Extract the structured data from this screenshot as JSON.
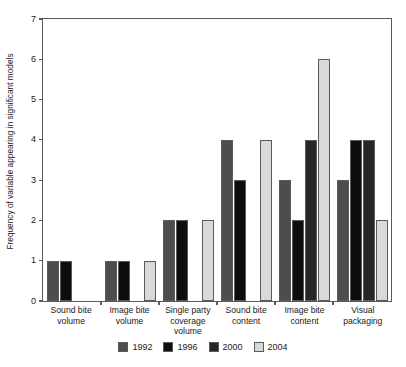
{
  "chart_data": {
    "type": "bar",
    "title": "",
    "subtitle": "",
    "xlabel": "",
    "ylabel": "Frequency of variable appearing in significant models",
    "ylim": [
      0,
      7
    ],
    "yticks": [
      0,
      1,
      2,
      3,
      4,
      5,
      6,
      7
    ],
    "grid": false,
    "legend_position": "bottom-center",
    "categories": [
      "Sound bite volume",
      "Image bite volume",
      "Single party coverage volume",
      "Sound bite content",
      "Image bite content",
      "Visual packaging"
    ],
    "series": [
      {
        "name": "1992",
        "color": "#4d4d4d",
        "values": [
          1,
          1,
          2,
          4,
          3,
          3
        ]
      },
      {
        "name": "1996",
        "color": "#0d0d0d",
        "values": [
          1,
          1,
          2,
          3,
          2,
          4
        ]
      },
      {
        "name": "2000",
        "color": "#262626",
        "values": [
          0,
          0,
          0,
          0,
          4,
          4
        ]
      },
      {
        "name": "2004",
        "color": "#d9d9d9",
        "values": [
          0,
          1,
          2,
          4,
          6,
          2
        ]
      }
    ]
  },
  "axis": {
    "y_tick_labels": [
      "7",
      "6",
      "5",
      "4",
      "3",
      "2",
      "1",
      "0"
    ],
    "y_title": "Frequency of variable appearing in significant models"
  },
  "category_lines": [
    [
      "Sound bite",
      "volume"
    ],
    [
      "Image bite",
      "volume"
    ],
    [
      "Single party",
      "coverage",
      "volume"
    ],
    [
      "Sound bite",
      "content"
    ],
    [
      "Image bite",
      "content"
    ],
    [
      "Visual",
      "packaging"
    ]
  ],
  "legend": {
    "items": [
      {
        "label": "1992",
        "color": "#4d4d4d"
      },
      {
        "label": "1996",
        "color": "#0d0d0d"
      },
      {
        "label": "2000",
        "color": "#262626"
      },
      {
        "label": "2004",
        "color": "#d9d9d9"
      }
    ]
  },
  "colors": {
    "axis": "#5a5a5a",
    "text": "#1a1a1a",
    "background": "#ffffff",
    "bar_outline": "#5a5a5a"
  }
}
